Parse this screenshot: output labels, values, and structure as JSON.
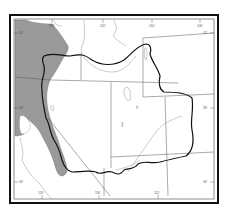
{
  "map": {
    "type": "regional-outline-map",
    "region_hint": "western interior basin outlined by heavy boundary",
    "colors": {
      "background": "#ffffff",
      "frame": "#111111",
      "shaded_region": "#9a9a9a",
      "heavy_boundary": "#111111",
      "state_lines": "#666666",
      "rivers": "#888888"
    },
    "tick_labels": {
      "top": [
        "118°",
        "114°",
        "110°",
        "106°"
      ],
      "bottom": [
        "120°",
        "116°",
        "112°"
      ],
      "left": [
        "42°",
        "38°",
        "34°"
      ],
      "right": [
        "42°",
        "38°",
        "34°"
      ]
    },
    "legend": {
      "shaded_region": "shaded area (west)",
      "heavy_outline": "outlined basin boundary"
    }
  }
}
